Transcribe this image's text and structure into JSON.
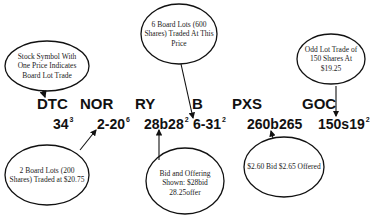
{
  "diagram": {
    "title": "",
    "symbols": [
      {
        "id": "dtc",
        "label": "DTC"
      },
      {
        "id": "nor",
        "label": "NOR"
      },
      {
        "id": "ry",
        "label": "RY"
      },
      {
        "id": "b",
        "label": "B"
      },
      {
        "id": "pxs",
        "label": "PXS"
      },
      {
        "id": "goc",
        "label": "GOC"
      }
    ],
    "prices": [
      {
        "symbol": "DTC",
        "main": "34",
        "sup": "3"
      },
      {
        "symbol": "NOR",
        "main": "2-20",
        "sup": "6"
      },
      {
        "symbol": "RY",
        "main": "28b28",
        "sup": "2"
      },
      {
        "symbol": "B",
        "main": "6-31",
        "sup": "2"
      },
      {
        "symbol": "PXS",
        "main": "260b265",
        "sup": ""
      },
      {
        "symbol": "GOC",
        "main": "150s19",
        "sup": "2"
      }
    ],
    "callouts": [
      {
        "id": "stock-symbol-note",
        "text": "Stock Symbol With One Price Indicates Board Lot Trade",
        "points_to": "DTC"
      },
      {
        "id": "six-board-lots-note",
        "text": "6 Board Lots (600 Shares) Traded At This Price",
        "points_to": "6-31²"
      },
      {
        "id": "odd-lot-note",
        "text": "Odd Lot Trade of 150 Shares At $19.25",
        "points_to": "150s19²"
      },
      {
        "id": "two-board-lots-note",
        "text": "2 Board Lots (200 Shares) Traded at $20.75",
        "points_to": "2-20⁶"
      },
      {
        "id": "bid-offering-note",
        "text": "Bid and Offering Shown: $28bid 28.25offer",
        "points_to": "28b28²"
      },
      {
        "id": "pxs-bid-note",
        "text": "$2.60 Bid $2.65 Offered",
        "points_to": "260b265"
      }
    ],
    "colors": {
      "stroke": "#111111",
      "background": "#ffffff"
    }
  }
}
